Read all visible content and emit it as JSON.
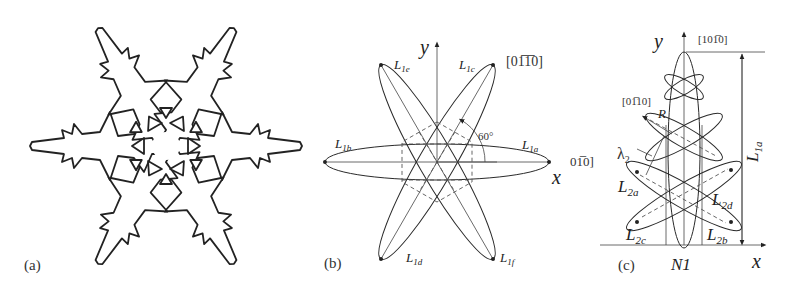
{
  "panels": [
    {
      "id": "a",
      "caption": "(a)",
      "description": "Six-fold dendritic snowflake outline with triangular holes"
    },
    {
      "id": "b",
      "caption": "(b)",
      "axes": {
        "x": "x",
        "y": "y"
      },
      "direction_top": "[01̅1̅0]",
      "direction_right": "01̅0]",
      "angle_label": "60°",
      "ellipses": [
        {
          "label": "L",
          "sub": "1a"
        },
        {
          "label": "L",
          "sub": "1b"
        },
        {
          "label": "L",
          "sub": "1c"
        },
        {
          "label": "L",
          "sub": "1d"
        },
        {
          "label": "L",
          "sub": "1e"
        },
        {
          "label": "L",
          "sub": "1f"
        }
      ]
    },
    {
      "id": "c",
      "caption": "(c)",
      "axes": {
        "x": "x",
        "y": "y"
      },
      "direction_top": "[101̅0]",
      "direction_left": "[01̅10]",
      "radius_label": "R",
      "lambda_label": "λ",
      "lambda_sub": "2",
      "height_label": {
        "label": "L",
        "sub": "1a"
      },
      "base_label": "N1",
      "ellipses": [
        {
          "label": "L",
          "sub": "2a"
        },
        {
          "label": "L",
          "sub": "2b"
        },
        {
          "label": "L",
          "sub": "2c"
        },
        {
          "label": "L",
          "sub": "2d"
        }
      ]
    }
  ]
}
